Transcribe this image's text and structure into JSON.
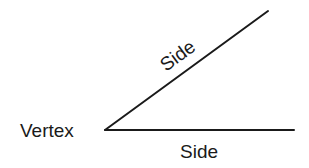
{
  "diagram": {
    "labels": {
      "vertex": "Vertex",
      "side_upper": "Side",
      "side_lower": "Side"
    },
    "geometry": {
      "vertex": [
        105,
        130
      ],
      "upper_end": [
        268,
        11
      ],
      "lower_end": [
        294,
        130
      ]
    },
    "colors": {
      "line": "#1a1a1a",
      "text": "#1a1a1a",
      "background": "#ffffff"
    }
  }
}
